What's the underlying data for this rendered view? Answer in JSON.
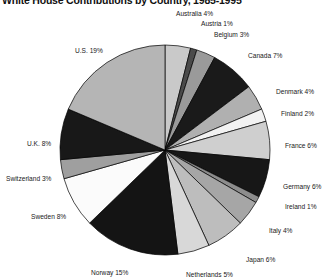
{
  "chart_data": {
    "type": "pie",
    "title": "White House Contributions by Country, 1985-1995",
    "xlabel": "",
    "ylabel": "",
    "legend": "none",
    "grid": false,
    "units": "percent",
    "label_format": "{name} {value}%",
    "categories": [
      "Australia",
      "Austria",
      "Belgium",
      "Canada",
      "Denmark",
      "Finland",
      "France",
      "Germany",
      "Ireland",
      "Italy",
      "Japan",
      "Netherlands",
      "Norway",
      "Sweden",
      "Switzerland",
      "U.K.",
      "U.S."
    ],
    "values": [
      4,
      1,
      3,
      7,
      4,
      2,
      6,
      6,
      1,
      4,
      6,
      5,
      15,
      8,
      3,
      8,
      19
    ],
    "slice_colors": [
      "#c9c9c9",
      "#4a4a4a",
      "#9a9a9a",
      "#1a1a1a",
      "#b0b0b0",
      "#f2f2f2",
      "#cfcfcf",
      "#171717",
      "#8d8d8d",
      "#a6a6a6",
      "#bdbdbd",
      "#d8d8d8",
      "#141414",
      "#fbfbfb",
      "#9f9f9f",
      "#181818",
      "#b5b5b5"
    ],
    "slices": [
      {
        "name": "Australia",
        "value": 4,
        "label": "Australia 4%",
        "color": "#c9c9c9"
      },
      {
        "name": "Austria",
        "value": 1,
        "label": "Austria 1%",
        "color": "#4a4a4a"
      },
      {
        "name": "Belgium",
        "value": 3,
        "label": "Belgium 3%",
        "color": "#9a9a9a"
      },
      {
        "name": "Canada",
        "value": 7,
        "label": "Canada 7%",
        "color": "#1a1a1a"
      },
      {
        "name": "Denmark",
        "value": 4,
        "label": "Denmark 4%",
        "color": "#b0b0b0"
      },
      {
        "name": "Finland",
        "value": 2,
        "label": "Finland 2%",
        "color": "#f2f2f2"
      },
      {
        "name": "France",
        "value": 6,
        "label": "France 6%",
        "color": "#cfcfcf"
      },
      {
        "name": "Germany",
        "value": 6,
        "label": "Germany 6%",
        "color": "#171717"
      },
      {
        "name": "Ireland",
        "value": 1,
        "label": "Ireland 1%",
        "color": "#8d8d8d"
      },
      {
        "name": "Italy",
        "value": 4,
        "label": "Italy 4%",
        "color": "#a6a6a6"
      },
      {
        "name": "Japan",
        "value": 6,
        "label": "Japan 6%",
        "color": "#bdbdbd"
      },
      {
        "name": "Netherlands",
        "value": 5,
        "label": "Netherlands 5%",
        "color": "#d8d8d8"
      },
      {
        "name": "Norway",
        "value": 15,
        "label": "Norway 15%",
        "color": "#141414"
      },
      {
        "name": "Sweden",
        "value": 8,
        "label": "Sweden 8%",
        "color": "#fbfbfb"
      },
      {
        "name": "Switzerland",
        "value": 3,
        "label": "Switzerland 3%",
        "color": "#9f9f9f"
      },
      {
        "name": "U.K.",
        "value": 8,
        "label": "U.K. 8%",
        "color": "#181818"
      },
      {
        "name": "U.S.",
        "value": 19,
        "label": "U.S. 19%",
        "color": "#b5b5b5"
      }
    ]
  },
  "geometry": {
    "center_x": 165,
    "center_y": 150,
    "radius": 105,
    "start_angle_deg": -90,
    "direction": "clockwise"
  },
  "label_positions": [
    {
      "name": "Australia",
      "x": 176,
      "y": 10,
      "align": "left"
    },
    {
      "name": "Austria",
      "x": 201,
      "y": 20,
      "align": "left"
    },
    {
      "name": "Belgium",
      "x": 214,
      "y": 31,
      "align": "left"
    },
    {
      "name": "Canada",
      "x": 248,
      "y": 52,
      "align": "left"
    },
    {
      "name": "Denmark",
      "x": 276,
      "y": 88,
      "align": "left"
    },
    {
      "name": "Finland",
      "x": 281,
      "y": 110,
      "align": "left"
    },
    {
      "name": "France",
      "x": 285,
      "y": 142,
      "align": "left"
    },
    {
      "name": "Germany",
      "x": 283,
      "y": 183,
      "align": "left"
    },
    {
      "name": "Ireland",
      "x": 285,
      "y": 203,
      "align": "left"
    },
    {
      "name": "Italy",
      "x": 269,
      "y": 227,
      "align": "left"
    },
    {
      "name": "Japan",
      "x": 246,
      "y": 256,
      "align": "left"
    },
    {
      "name": "Netherlands",
      "x": 186,
      "y": 271,
      "align": "left"
    },
    {
      "name": "Norway",
      "x": 91,
      "y": 269,
      "align": "left"
    },
    {
      "name": "Sweden",
      "x": 31,
      "y": 213,
      "align": "left"
    },
    {
      "name": "Switzerland",
      "x": 6,
      "y": 175,
      "align": "left"
    },
    {
      "name": "U.K.",
      "x": 27,
      "y": 140,
      "align": "left"
    },
    {
      "name": "U.S.",
      "x": 75,
      "y": 47,
      "align": "left"
    }
  ]
}
